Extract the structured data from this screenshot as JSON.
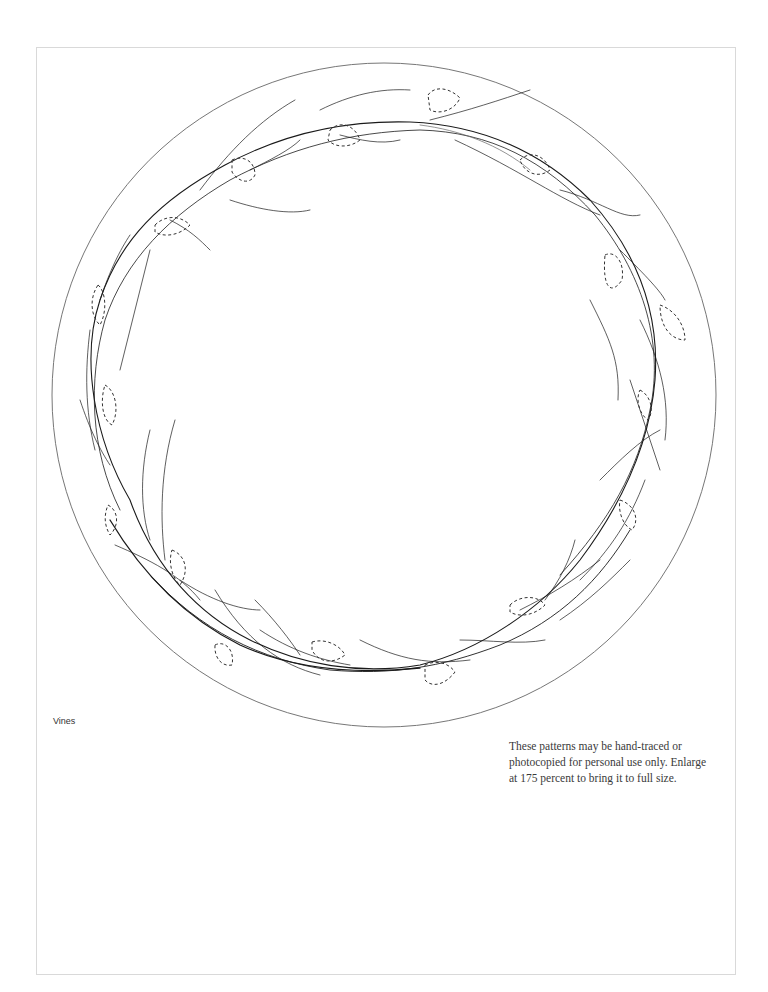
{
  "page": {
    "caption": "Vines",
    "notice_lines": [
      "These patterns may be hand-traced or",
      "photocopied for personal use only. Enlarge",
      "at 175 percent to bring it to full size."
    ],
    "enlarge_percent": 175
  },
  "pattern": {
    "name": "Vines",
    "outer_circle": {
      "cx": 384,
      "cy": 395,
      "r": 332,
      "stroke": "#777777"
    },
    "vine_color": "#1a1a1a",
    "leaf_outline_style": "dashed",
    "leaf_count": 17
  }
}
